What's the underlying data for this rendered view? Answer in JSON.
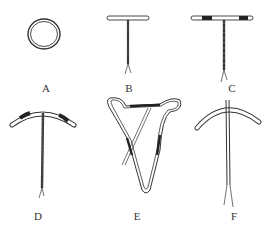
{
  "figure": {
    "items": [
      {
        "id": "A",
        "label": "A",
        "shape": "ring",
        "label_x": 46,
        "label_y": 83
      },
      {
        "id": "B",
        "label": "B",
        "shape": "T",
        "label_x": 129,
        "label_y": 83
      },
      {
        "id": "C",
        "label": "C",
        "shape": "T-banded",
        "label_x": 232,
        "label_y": 83
      },
      {
        "id": "D",
        "label": "D",
        "shape": "curved-T-banded",
        "label_x": 38,
        "label_y": 193
      },
      {
        "id": "E",
        "label": "E",
        "shape": "uterine-frame",
        "label_x": 137,
        "label_y": 193
      },
      {
        "id": "F",
        "label": "F",
        "shape": "curved-arch",
        "label_x": 234,
        "label_y": 193
      }
    ],
    "colors": {
      "line": "#333333",
      "background": "#ffffff",
      "band": "#222222"
    }
  }
}
